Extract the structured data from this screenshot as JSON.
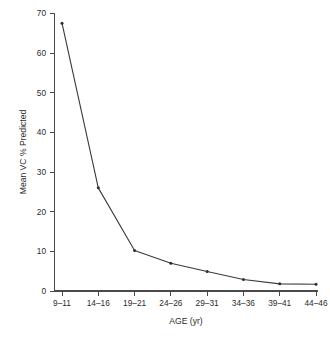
{
  "chart_data": {
    "type": "line",
    "title": "",
    "subtitle": "",
    "xlabel": "AGE (yr)",
    "ylabel": "Mean VC % Predicted",
    "categories": [
      "9–11",
      "14–16",
      "19–21",
      "24–26",
      "29–31",
      "34–36",
      "39–41",
      "44–46"
    ],
    "values": [
      67.5,
      26,
      10.2,
      7,
      4.9,
      2.9,
      1.8,
      1.7
    ],
    "series": [
      {
        "name": "Mean VC % Predicted",
        "values": [
          67.5,
          26,
          10.2,
          7,
          4.9,
          2.9,
          1.8,
          1.7
        ]
      }
    ],
    "ylim": [
      0,
      75
    ],
    "yticks": [
      0,
      10,
      20,
      30,
      40,
      50,
      60,
      70
    ],
    "ytick_labels": [
      "0",
      "10",
      "20",
      "30",
      "40",
      "50",
      "60",
      "70"
    ],
    "xtick_labels": [
      "9–11",
      "14–16",
      "19–21",
      "24–26",
      "29–31",
      "34–36",
      "39–41",
      "44–46"
    ],
    "grid": false,
    "legend": false,
    "legend_position": "none",
    "marker": "dot",
    "line_color": "#3a3a3a",
    "marker_color": "#2e2e2e",
    "axis_color": "#4a4a4a",
    "background_color": "#ffffff"
  }
}
